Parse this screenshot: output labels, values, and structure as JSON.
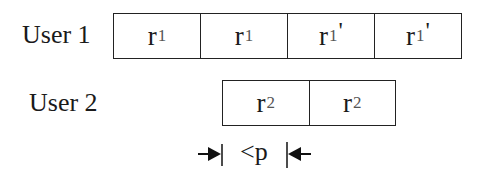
{
  "diagram": {
    "rows": [
      {
        "label": "User 1",
        "cells": [
          {
            "base": "r",
            "sub": "1",
            "prime": ""
          },
          {
            "base": "r",
            "sub": "1",
            "prime": ""
          },
          {
            "base": "r",
            "sub": "1",
            "prime": "'"
          },
          {
            "base": "r",
            "sub": "1",
            "prime": "'"
          }
        ]
      },
      {
        "label": "User 2",
        "cells": [
          {
            "base": "r",
            "sub": "2",
            "prime": ""
          },
          {
            "base": "r",
            "sub": "2",
            "prime": ""
          }
        ]
      }
    ],
    "annotation": {
      "text": "<p",
      "meaning": "offset between User 1 start and User 2 start is less than p"
    },
    "colors": {
      "stroke": "#222222",
      "background": "#ffffff"
    }
  }
}
